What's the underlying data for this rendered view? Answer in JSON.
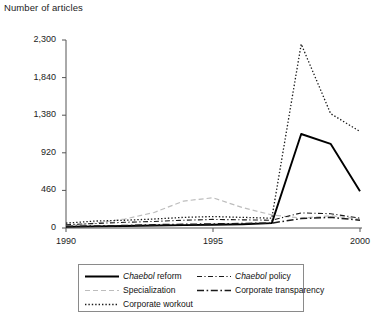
{
  "chart_data": {
    "type": "line",
    "title": "",
    "ylabel": "Number of articles",
    "xlabel": "",
    "xlim": [
      1990,
      2000
    ],
    "ylim": [
      0,
      2300
    ],
    "grid": false,
    "legend_position": "bottom",
    "x": [
      1990,
      1991,
      1992,
      1993,
      1994,
      1995,
      1996,
      1997,
      1998,
      1999,
      2000
    ],
    "y_ticks": [
      0,
      460,
      920,
      1380,
      1840,
      2300
    ],
    "y_tick_labels": [
      "0",
      "460",
      "920",
      "1,380",
      "1,840",
      "2,300"
    ],
    "x_ticks": [
      1990,
      1995,
      2000
    ],
    "x_tick_labels": [
      "1990",
      "1995",
      "2000"
    ],
    "series": [
      {
        "name": "Chaebol reform",
        "style": "solid",
        "color": "#000000",
        "width": 1.9,
        "values": [
          15,
          20,
          25,
          30,
          35,
          40,
          45,
          60,
          1150,
          1030,
          450
        ]
      },
      {
        "name": "Specialization",
        "style": "dashed",
        "color": "#bdbdbd",
        "width": 1.2,
        "values": [
          25,
          60,
          110,
          190,
          330,
          370,
          250,
          160,
          120,
          150,
          110
        ]
      },
      {
        "name": "Corporate workout",
        "style": "dotted",
        "color": "#1a1a1a",
        "width": 1.3,
        "values": [
          60,
          85,
          95,
          110,
          130,
          140,
          130,
          120,
          2250,
          1400,
          1180
        ]
      },
      {
        "name": "Chaebol policy",
        "style": "dash-dot-fine",
        "color": "#1a1a1a",
        "width": 1.1,
        "values": [
          40,
          55,
          70,
          80,
          95,
          105,
          100,
          95,
          185,
          175,
          120
        ]
      },
      {
        "name": "Corporate transparency",
        "style": "dash-dot-heavy",
        "color": "#1a1a1a",
        "width": 1.5,
        "values": [
          20,
          25,
          30,
          40,
          45,
          50,
          55,
          60,
          115,
          130,
          95
        ]
      }
    ]
  },
  "axis": {
    "y_title": "Number of articles",
    "y_labels": [
      "2,300",
      "1,840",
      "1,380",
      "920",
      "460",
      "0"
    ],
    "x_labels": [
      "1990",
      "1995",
      "2000"
    ]
  },
  "legend": {
    "entries": [
      {
        "label_pre": "Chaebol",
        "label_post": " reform",
        "style": "solid",
        "column": 0,
        "row": 0
      },
      {
        "label_pre": "Chaebol",
        "label_post": " policy",
        "style": "dash-dot-fine",
        "column": 1,
        "row": 0
      },
      {
        "label_pre": "",
        "label_post": "Specialization",
        "style": "dashed",
        "column": 0,
        "row": 1
      },
      {
        "label_pre": "",
        "label_post": "Corporate transparency",
        "style": "dash-dot-heavy",
        "column": 1,
        "row": 1
      },
      {
        "label_pre": "",
        "label_post": "Corporate workout",
        "style": "dotted",
        "column": 0,
        "row": 2
      }
    ]
  }
}
